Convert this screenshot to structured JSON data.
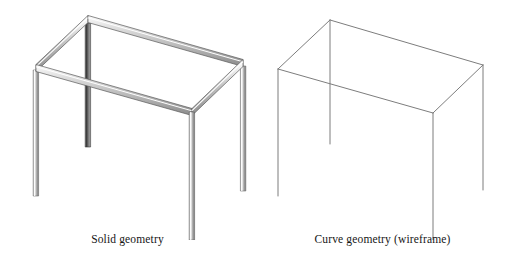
{
  "figure": {
    "background_color": "#ffffff",
    "panels": [
      {
        "id": "solid",
        "caption": "Solid geometry",
        "render_style": "solid",
        "beam_fill_light": "#f2f2f2",
        "beam_fill_mid": "#c8c8c8",
        "beam_fill_dark": "#9a9a9a",
        "edge_color": "#4a4a4a"
      },
      {
        "id": "curve",
        "caption": "Curve geometry (wireframe)",
        "render_style": "wireframe",
        "line_color": "#7d7d7d",
        "line_width": "1"
      }
    ]
  },
  "geometry": {
    "description": "Isometric rectangular table frame: four vertical legs joined by a top rectangular beam frame",
    "view": "isometric",
    "vertices_solid": {
      "top_back_apex": [
        88,
        19
      ],
      "top_left": [
        36,
        68
      ],
      "top_right": [
        243,
        63
      ],
      "top_front": [
        192,
        112
      ],
      "leg_left_bottom": [
        36,
        196
      ],
      "leg_back_bottom": [
        88,
        147
      ],
      "leg_right_bottom": [
        243,
        191
      ],
      "leg_front_bottom": [
        192,
        240
      ]
    },
    "vertices_curve": {
      "top_back_apex": [
        330,
        20
      ],
      "top_left": [
        278,
        69
      ],
      "top_right": [
        483,
        65
      ],
      "top_front": [
        433,
        113
      ],
      "leg_left_bottom": [
        278,
        196
      ],
      "leg_back_bottom": [
        330,
        144
      ],
      "leg_right_bottom": [
        483,
        190
      ],
      "leg_front_bottom": [
        433,
        240
      ]
    },
    "member_count": 8,
    "top_frame_members": 4,
    "leg_members": 4
  },
  "captions": {
    "solid": "Solid geometry",
    "curve": "Curve geometry (wireframe)"
  }
}
